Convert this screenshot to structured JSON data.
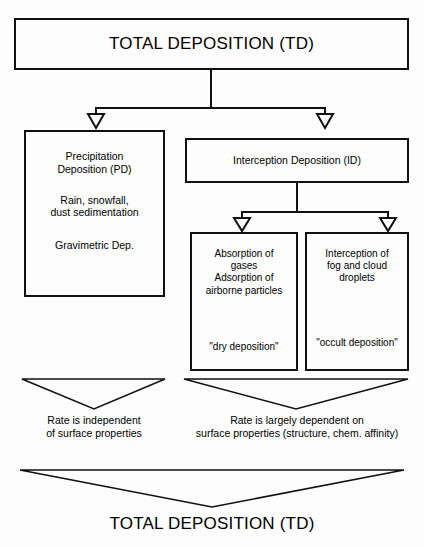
{
  "diagram": {
    "top_title": "TOTAL DEPOSITION (TD)",
    "bottom_title": "TOTAL DEPOSITION (TD)",
    "nodes": {
      "precipitation_deposition": {
        "heading": "Precipitation\nDeposition (PD)",
        "detail": "Rain, snowfall,\ndust sedimentation",
        "note": "Gravimetric Dep."
      },
      "interception_deposition": {
        "heading": "Interception Deposition (ID)"
      },
      "dry_deposition": {
        "detail": "Absorption of\ngases\nAdsorption of\nairborne particles",
        "quote": "\"dry deposition\""
      },
      "occult_deposition": {
        "detail": "Interception of\nfog and cloud\ndroplets",
        "quote": "\"occult deposition\""
      }
    },
    "captions": {
      "left": "Rate is independent\nof surface properties",
      "right": "Rate is largely dependent on\nsurface properties (structure, chem. affinity)"
    },
    "colors": {
      "stroke": "#111111",
      "background": "#fdfdfd",
      "text": "#000000"
    }
  }
}
